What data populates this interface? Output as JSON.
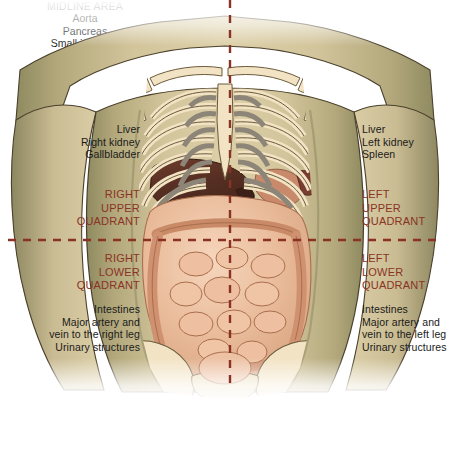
{
  "figure": {
    "colors": {
      "divider_line": "#8a3324",
      "quadrant_label_text": "#8a3324",
      "organ_label_text": "#1a1a1a",
      "background": "#ffffff",
      "skin_light": "#d8c9a3",
      "skin_mid": "#c3b48b",
      "skin_shadow": "#9d9a६e",
      "bone": "#f2e3c4",
      "cartilage": "#8d8577",
      "liver": "#5d3326",
      "intestine": "#e7b79a",
      "colon": "#edc3a6",
      "stomach": "#c98a6c"
    },
    "dividers": {
      "vertical_label": "midline-vertical-divider",
      "horizontal_label": "transumbilical-horizontal-divider"
    }
  },
  "quadrants": {
    "right_upper": {
      "name": "RIGHT\nUPPER\nQUADRANT",
      "organs": "Liver\nRight kidney\nGallbladder"
    },
    "right_lower": {
      "name": "RIGHT\nLOWER\nQUADRANT",
      "organs": "Intestines\nMajor artery and\nvein to the right leg\nUrinary structures"
    },
    "left_upper": {
      "name": "LEFT\nUPPER\nQUADRANT",
      "organs": "Liver\nLeft kidney\nSpleen"
    },
    "left_lower": {
      "name": "LEFT\nLOWER\nQUADRANT",
      "organs": "Intestines\nMajor artery and\nvein to the left leg\nUrinary structures"
    }
  },
  "midline": {
    "title": "MIDLINE AREA",
    "organs": "Aorta\nPancreas\nSmall intestine\nBladder\nSpine"
  }
}
